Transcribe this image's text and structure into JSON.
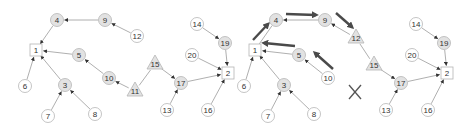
{
  "colors": {
    "edge": "#9a9a9a",
    "arrowhead": "#333333",
    "bold_arrow": "#4a4a4a",
    "node_stroke": "#b5b5b5",
    "node_fill_plain": "#ffffff",
    "node_fill_shaded": "#e2e2e2",
    "text": "#333333"
  },
  "panels": [
    {
      "name": "left",
      "nodes": [
        {
          "id": "1",
          "label": "1",
          "shape": "square",
          "x": 36,
          "y": 50,
          "shaded": false
        },
        {
          "id": "2",
          "label": "2",
          "shape": "square",
          "x": 228,
          "y": 73,
          "shaded": false
        },
        {
          "id": "3",
          "label": "3",
          "shape": "circle",
          "x": 65,
          "y": 85,
          "shaded": true
        },
        {
          "id": "4",
          "label": "4",
          "shape": "circle",
          "x": 57,
          "y": 20,
          "shaded": true
        },
        {
          "id": "5",
          "label": "5",
          "shape": "circle",
          "x": 79,
          "y": 55,
          "shaded": true
        },
        {
          "id": "6",
          "label": "6",
          "shape": "circle",
          "x": 25,
          "y": 86,
          "shaded": false
        },
        {
          "id": "7",
          "label": "7",
          "shape": "circle",
          "x": 48,
          "y": 116,
          "shaded": false
        },
        {
          "id": "8",
          "label": "8",
          "shape": "circle",
          "x": 95,
          "y": 114,
          "shaded": false
        },
        {
          "id": "9",
          "label": "9",
          "shape": "circle",
          "x": 105,
          "y": 20,
          "shaded": true
        },
        {
          "id": "10",
          "label": "10",
          "shape": "circle",
          "x": 109,
          "y": 78,
          "shaded": true
        },
        {
          "id": "11",
          "label": "11",
          "shape": "triangle",
          "x": 135,
          "y": 91,
          "shaded": true
        },
        {
          "id": "12",
          "label": "12",
          "shape": "circle",
          "x": 137,
          "y": 36,
          "shaded": false
        },
        {
          "id": "13",
          "label": "13",
          "shape": "circle",
          "x": 167,
          "y": 110,
          "shaded": false
        },
        {
          "id": "14",
          "label": "14",
          "shape": "circle",
          "x": 197,
          "y": 24,
          "shaded": false
        },
        {
          "id": "15",
          "label": "15",
          "shape": "triangle",
          "x": 155,
          "y": 64,
          "shaded": true
        },
        {
          "id": "16",
          "label": "16",
          "shape": "circle",
          "x": 208,
          "y": 110,
          "shaded": false
        },
        {
          "id": "17",
          "label": "17",
          "shape": "circle",
          "x": 181,
          "y": 83,
          "shaded": true
        },
        {
          "id": "19",
          "label": "19",
          "shape": "circle",
          "x": 225,
          "y": 43,
          "shaded": true
        },
        {
          "id": "20",
          "label": "20",
          "shape": "circle",
          "x": 192,
          "y": 55,
          "shaded": false
        }
      ],
      "edges": [
        {
          "from": "9",
          "to": "4",
          "arrow": true
        },
        {
          "from": "12",
          "to": "9",
          "arrow": true
        },
        {
          "from": "4",
          "to": "1",
          "arrow": true
        },
        {
          "from": "5",
          "to": "1",
          "arrow": true
        },
        {
          "from": "6",
          "to": "1",
          "arrow": true
        },
        {
          "from": "3",
          "to": "1",
          "arrow": true
        },
        {
          "from": "7",
          "to": "3",
          "arrow": true
        },
        {
          "from": "8",
          "to": "3",
          "arrow": true
        },
        {
          "from": "10",
          "to": "5",
          "arrow": true
        },
        {
          "from": "11",
          "to": "10",
          "arrow": true
        },
        {
          "from": "11",
          "to": "15",
          "arrow": false
        },
        {
          "from": "15",
          "to": "17",
          "arrow": true
        },
        {
          "from": "13",
          "to": "17",
          "arrow": true
        },
        {
          "from": "17",
          "to": "2",
          "arrow": true
        },
        {
          "from": "20",
          "to": "2",
          "arrow": true
        },
        {
          "from": "19",
          "to": "2",
          "arrow": true
        },
        {
          "from": "14",
          "to": "19",
          "arrow": true
        },
        {
          "from": "16",
          "to": "2",
          "arrow": true
        }
      ],
      "bold_arrows": [],
      "markers": []
    },
    {
      "name": "right",
      "nodes": [
        {
          "id": "1",
          "label": "1",
          "shape": "square",
          "x": 255,
          "y": 50,
          "shaded": false
        },
        {
          "id": "2",
          "label": "2",
          "shape": "square",
          "x": 447,
          "y": 73,
          "shaded": false
        },
        {
          "id": "3",
          "label": "3",
          "shape": "circle",
          "x": 284,
          "y": 85,
          "shaded": true
        },
        {
          "id": "4",
          "label": "4",
          "shape": "circle",
          "x": 276,
          "y": 20,
          "shaded": true
        },
        {
          "id": "5",
          "label": "5",
          "shape": "circle",
          "x": 299,
          "y": 55,
          "shaded": true
        },
        {
          "id": "6",
          "label": "6",
          "shape": "circle",
          "x": 244,
          "y": 86,
          "shaded": false
        },
        {
          "id": "7",
          "label": "7",
          "shape": "circle",
          "x": 268,
          "y": 116,
          "shaded": false
        },
        {
          "id": "8",
          "label": "8",
          "shape": "circle",
          "x": 314,
          "y": 114,
          "shaded": false
        },
        {
          "id": "9",
          "label": "9",
          "shape": "circle",
          "x": 325,
          "y": 20,
          "shaded": true
        },
        {
          "id": "10",
          "label": "10",
          "shape": "circle",
          "x": 328,
          "y": 78,
          "shaded": false
        },
        {
          "id": "12",
          "label": "12",
          "shape": "triangle",
          "x": 356,
          "y": 38,
          "shaded": true
        },
        {
          "id": "13",
          "label": "13",
          "shape": "circle",
          "x": 386,
          "y": 110,
          "shaded": false
        },
        {
          "id": "14",
          "label": "14",
          "shape": "circle",
          "x": 416,
          "y": 24,
          "shaded": false
        },
        {
          "id": "15",
          "label": "15",
          "shape": "triangle",
          "x": 374,
          "y": 65,
          "shaded": true
        },
        {
          "id": "16",
          "label": "16",
          "shape": "circle",
          "x": 428,
          "y": 110,
          "shaded": false
        },
        {
          "id": "17",
          "label": "17",
          "shape": "circle",
          "x": 401,
          "y": 83,
          "shaded": true
        },
        {
          "id": "19",
          "label": "19",
          "shape": "circle",
          "x": 444,
          "y": 43,
          "shaded": true
        },
        {
          "id": "20",
          "label": "20",
          "shape": "circle",
          "x": 412,
          "y": 55,
          "shaded": false
        }
      ],
      "edges": [
        {
          "from": "9",
          "to": "4",
          "arrow": true
        },
        {
          "from": "12",
          "to": "9",
          "arrow": true
        },
        {
          "from": "4",
          "to": "1",
          "arrow": false
        },
        {
          "from": "5",
          "to": "1",
          "arrow": true
        },
        {
          "from": "6",
          "to": "1",
          "arrow": true
        },
        {
          "from": "3",
          "to": "1",
          "arrow": true
        },
        {
          "from": "7",
          "to": "3",
          "arrow": true
        },
        {
          "from": "8",
          "to": "3",
          "arrow": true
        },
        {
          "from": "10",
          "to": "5",
          "arrow": true
        },
        {
          "from": "12",
          "to": "15",
          "arrow": false
        },
        {
          "from": "15",
          "to": "17",
          "arrow": true
        },
        {
          "from": "13",
          "to": "17",
          "arrow": true
        },
        {
          "from": "17",
          "to": "2",
          "arrow": true
        },
        {
          "from": "20",
          "to": "2",
          "arrow": true
        },
        {
          "from": "19",
          "to": "2",
          "arrow": true
        },
        {
          "from": "14",
          "to": "19",
          "arrow": true
        },
        {
          "from": "16",
          "to": "2",
          "arrow": true
        }
      ],
      "bold_arrows": [
        {
          "x1": 253,
          "y1": 40,
          "x2": 268,
          "y2": 24
        },
        {
          "x1": 286,
          "y1": 14,
          "x2": 316,
          "y2": 15
        },
        {
          "x1": 336,
          "y1": 13,
          "x2": 352,
          "y2": 27
        },
        {
          "x1": 295,
          "y1": 46,
          "x2": 264,
          "y2": 43
        },
        {
          "x1": 333,
          "y1": 69,
          "x2": 315,
          "y2": 53
        }
      ],
      "markers": [
        {
          "type": "x-mark",
          "x": 355,
          "y": 92
        }
      ]
    }
  ]
}
